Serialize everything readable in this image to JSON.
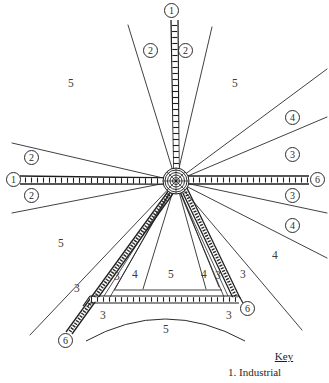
{
  "figure": {
    "center": {
      "x": 176,
      "y": 181,
      "rings": 5,
      "label": "central-business-district-hub"
    },
    "ink_color": "#1f1f1f",
    "background": "#ffffff"
  },
  "railways": [
    {
      "name": "north-railway",
      "terminus_label": "1",
      "x1": 176,
      "y1": 181,
      "x2": 172,
      "y2": 20
    },
    {
      "name": "west-railway",
      "terminus_label": "1",
      "x1": 176,
      "y1": 181,
      "x2": 20,
      "y2": 180
    },
    {
      "name": "east-railway",
      "terminus_label": "6",
      "x1": 176,
      "y1": 181,
      "x2": 310,
      "y2": 180
    },
    {
      "name": "southwest-railway",
      "terminus_label": "6",
      "x1": 176,
      "y1": 181,
      "x2": 67,
      "y2": 334
    },
    {
      "name": "southeast-railway",
      "terminus_label": "6",
      "x1": 176,
      "y1": 181,
      "x2": 238,
      "y2": 303
    },
    {
      "name": "south-ring-railway",
      "terminus_label": "",
      "x1": 91,
      "y1": 299,
      "x2": 240,
      "y2": 299
    }
  ],
  "terminus_markers": [
    {
      "name": "terminus-north",
      "label": "1",
      "x": 164,
      "y": 3
    },
    {
      "name": "terminus-west",
      "label": "1",
      "x": 6,
      "y": 172
    },
    {
      "name": "terminus-east",
      "label": "6",
      "x": 310,
      "y": 172
    },
    {
      "name": "terminus-southwest",
      "label": "6",
      "x": 58,
      "y": 333
    },
    {
      "name": "terminus-southeast",
      "label": "6",
      "x": 240,
      "y": 301
    }
  ],
  "sector_labels_circled": [
    {
      "name": "sector-2-north-west",
      "label": "2",
      "x": 143,
      "y": 43
    },
    {
      "name": "sector-2-north-east",
      "label": "2",
      "x": 178,
      "y": 43
    },
    {
      "name": "sector-2-west-upper",
      "label": "2",
      "x": 24,
      "y": 150
    },
    {
      "name": "sector-2-west-lower",
      "label": "2",
      "x": 24,
      "y": 188
    },
    {
      "name": "sector-4-east-upper",
      "label": "4",
      "x": 285,
      "y": 110
    },
    {
      "name": "sector-3-east-upper",
      "label": "3",
      "x": 285,
      "y": 147
    },
    {
      "name": "sector-3-east-lower",
      "label": "3",
      "x": 285,
      "y": 188
    },
    {
      "name": "sector-4-east-lower",
      "label": "4",
      "x": 285,
      "y": 218
    }
  ],
  "sector_labels_plain": [
    {
      "name": "zone-5-upper-left",
      "label": "5",
      "x": 68,
      "y": 78
    },
    {
      "name": "zone-5-upper-right",
      "label": "5",
      "x": 232,
      "y": 78
    },
    {
      "name": "zone-4-lower-right-outer",
      "label": "4",
      "x": 272,
      "y": 250
    },
    {
      "name": "zone-5-lower-left",
      "label": "5",
      "x": 58,
      "y": 238
    },
    {
      "name": "zone-3-left-outer",
      "label": "3",
      "x": 74,
      "y": 283
    },
    {
      "name": "zone-3-left-inner",
      "label": "3",
      "x": 114,
      "y": 271
    },
    {
      "name": "zone-4-inner-left",
      "label": "4",
      "x": 132,
      "y": 269
    },
    {
      "name": "zone-5-inner-center",
      "label": "5",
      "x": 168,
      "y": 269
    },
    {
      "name": "zone-4-inner-right",
      "label": "4",
      "x": 201,
      "y": 269
    },
    {
      "name": "zone-3-inner-right",
      "label": "3",
      "x": 215,
      "y": 270
    },
    {
      "name": "zone-3-right-outer",
      "label": "3",
      "x": 240,
      "y": 269
    },
    {
      "name": "zone-3-below-left",
      "label": "3",
      "x": 100,
      "y": 310
    },
    {
      "name": "zone-3-below-right",
      "label": "3",
      "x": 226,
      "y": 310
    },
    {
      "name": "zone-5-bottom-arc",
      "label": "5",
      "x": 163,
      "y": 324
    }
  ],
  "key": {
    "title": "Key",
    "entries": [
      {
        "number": "1.",
        "text": "1. Industrial"
      }
    ],
    "first_entry": "1. Industrial"
  }
}
